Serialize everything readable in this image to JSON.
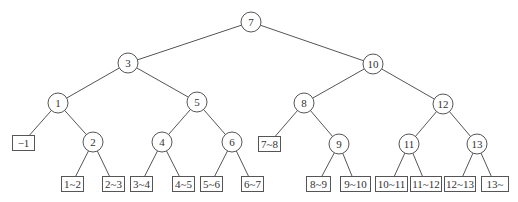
{
  "caption": "",
  "colors": {
    "line": "#555555",
    "text": "#333333",
    "background": "#ffffff"
  },
  "internal_nodes": [
    {
      "id": "n7",
      "label": "7",
      "x": 251,
      "y": 22,
      "r": 10
    },
    {
      "id": "n3",
      "label": "3",
      "x": 128,
      "y": 63,
      "r": 10
    },
    {
      "id": "n10",
      "label": "10",
      "x": 373,
      "y": 64,
      "r": 10
    },
    {
      "id": "n1",
      "label": "1",
      "x": 58,
      "y": 103,
      "r": 10
    },
    {
      "id": "n5",
      "label": "5",
      "x": 197,
      "y": 102,
      "r": 10
    },
    {
      "id": "n8",
      "label": "8",
      "x": 304,
      "y": 103,
      "r": 10
    },
    {
      "id": "n12",
      "label": "12",
      "x": 443,
      "y": 104,
      "r": 10
    },
    {
      "id": "n2",
      "label": "2",
      "x": 93,
      "y": 142,
      "r": 10
    },
    {
      "id": "n4",
      "label": "4",
      "x": 162,
      "y": 142,
      "r": 10
    },
    {
      "id": "n6",
      "label": "6",
      "x": 232,
      "y": 142,
      "r": 10
    },
    {
      "id": "n9",
      "label": "9",
      "x": 339,
      "y": 144,
      "r": 10
    },
    {
      "id": "n11",
      "label": "11",
      "x": 409,
      "y": 144,
      "r": 10
    },
    {
      "id": "n13",
      "label": "13",
      "x": 477,
      "y": 144,
      "r": 10
    }
  ],
  "leaves": [
    {
      "id": "l_m1",
      "label": "−1",
      "x": 12,
      "y": 135,
      "w": 22,
      "h": 15
    },
    {
      "id": "l_1_2",
      "label": "1~2",
      "x": 61,
      "y": 176,
      "w": 22,
      "h": 15
    },
    {
      "id": "l_2_3",
      "label": "2~3",
      "x": 102,
      "y": 176,
      "w": 22,
      "h": 15
    },
    {
      "id": "l_3_4",
      "label": "3~4",
      "x": 130,
      "y": 176,
      "w": 22,
      "h": 15
    },
    {
      "id": "l_4_5",
      "label": "4~5",
      "x": 172,
      "y": 176,
      "w": 22,
      "h": 15
    },
    {
      "id": "l_5_6",
      "label": "5~6",
      "x": 200,
      "y": 176,
      "w": 22,
      "h": 15
    },
    {
      "id": "l_6_7",
      "label": "6~7",
      "x": 241,
      "y": 176,
      "w": 22,
      "h": 15
    },
    {
      "id": "l_7_8",
      "label": "7~8",
      "x": 258,
      "y": 136,
      "w": 22,
      "h": 15
    },
    {
      "id": "l_8_9",
      "label": "8~9",
      "x": 306,
      "y": 176,
      "w": 24,
      "h": 15
    },
    {
      "id": "l_9_10",
      "label": "9~10",
      "x": 340,
      "y": 176,
      "w": 30,
      "h": 15
    },
    {
      "id": "l_10_11",
      "label": "10~11",
      "x": 375,
      "y": 176,
      "w": 32,
      "h": 15
    },
    {
      "id": "l_11_12",
      "label": "11~12",
      "x": 410,
      "y": 176,
      "w": 31,
      "h": 15
    },
    {
      "id": "l_12_13",
      "label": "12~13",
      "x": 444,
      "y": 176,
      "w": 31,
      "h": 15
    },
    {
      "id": "l_13_",
      "label": "13~",
      "x": 481,
      "y": 176,
      "w": 27,
      "h": 15
    }
  ],
  "edges": [
    [
      "n7",
      "n3"
    ],
    [
      "n7",
      "n10"
    ],
    [
      "n3",
      "n1"
    ],
    [
      "n3",
      "n5"
    ],
    [
      "n10",
      "n8"
    ],
    [
      "n10",
      "n12"
    ],
    [
      "n1",
      "l_m1"
    ],
    [
      "n1",
      "n2"
    ],
    [
      "n5",
      "n4"
    ],
    [
      "n5",
      "n6"
    ],
    [
      "n8",
      "l_7_8"
    ],
    [
      "n8",
      "n9"
    ],
    [
      "n12",
      "n11"
    ],
    [
      "n12",
      "n13"
    ],
    [
      "n2",
      "l_1_2"
    ],
    [
      "n2",
      "l_2_3"
    ],
    [
      "n4",
      "l_3_4"
    ],
    [
      "n4",
      "l_4_5"
    ],
    [
      "n6",
      "l_5_6"
    ],
    [
      "n6",
      "l_6_7"
    ],
    [
      "n9",
      "l_8_9"
    ],
    [
      "n9",
      "l_9_10"
    ],
    [
      "n11",
      "l_10_11"
    ],
    [
      "n11",
      "l_11_12"
    ],
    [
      "n13",
      "l_12_13"
    ],
    [
      "n13",
      "l_13_"
    ]
  ]
}
